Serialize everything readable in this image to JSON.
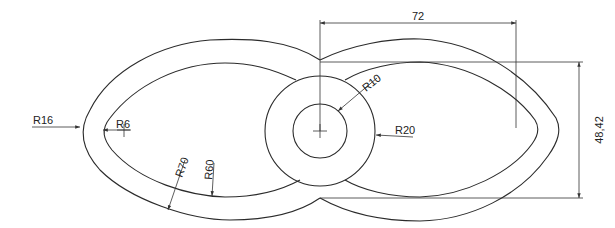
{
  "drawing": {
    "type": "technical-cad-drawing",
    "description": "Figure-eight / eye-shaped part with central concentric circles and offset outline",
    "colors": {
      "background": "#ffffff",
      "line": "#2b2b2b"
    }
  },
  "dimensions": {
    "horizontal": {
      "label": "72"
    },
    "vertical": {
      "label": "48,42"
    }
  },
  "radius_labels": {
    "r16": "R16",
    "r6": "R6",
    "r70": "R70",
    "r60": "R60",
    "r10": "R10",
    "r20": "R20"
  }
}
